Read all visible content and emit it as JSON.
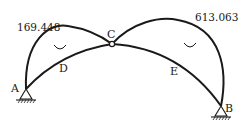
{
  "diagram": {
    "type": "three-hinged arch bending moment diagram",
    "values": {
      "left_peak": "169.448",
      "right_peak": "613.063"
    },
    "points": {
      "A": "A",
      "B": "B",
      "C": "C",
      "D": "D",
      "E": "E"
    },
    "colors": {
      "line": "#1a1a1a",
      "background": "#ffffff"
    }
  }
}
